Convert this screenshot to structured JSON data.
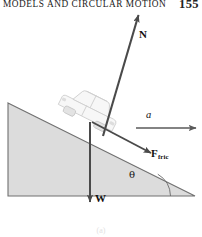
{
  "runhead": {
    "title": "MODELS AND CIRCULAR MOTION",
    "folio": "155"
  },
  "figure": {
    "part_label": "(a)",
    "caption": "",
    "scene": "car on an inclined plane free-body diagram",
    "incline": {
      "fill_color": "#dcdcdc",
      "stroke_color": "#6e6e6e",
      "apex": "top-left",
      "angle_label": "θ"
    },
    "object": {
      "name": "car",
      "outline_color": "#d2d2d2"
    },
    "vectors": [
      {
        "id": "normal",
        "label": "N",
        "description": "normal force, perpendicular to incline surface, pointing up-right",
        "color": "#4a4a4a"
      },
      {
        "id": "acceleration",
        "label": "a",
        "description": "acceleration, horizontal, pointing right",
        "color": "#5a5a5a",
        "style": "italic"
      },
      {
        "id": "friction",
        "label_main": "F",
        "label_sub": "fric",
        "description": "friction force, along incline, pointing down-right",
        "color": "#4a4a4a"
      },
      {
        "id": "weight",
        "label": "W",
        "description": "weight, vertical, pointing down",
        "color": "#4a4a4a"
      }
    ]
  }
}
